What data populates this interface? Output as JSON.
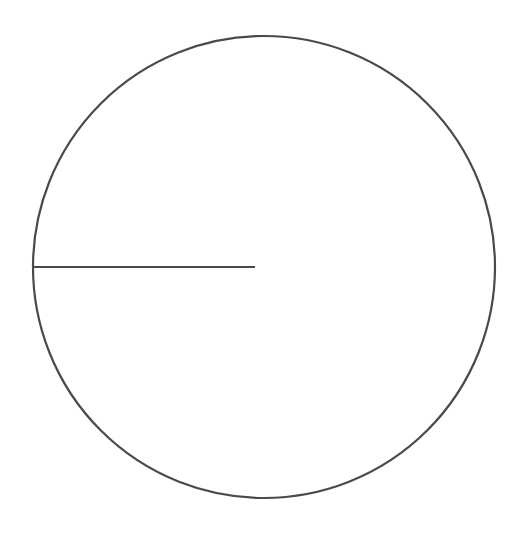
{
  "diagram": {
    "type": "circle-with-radius",
    "canvas": {
      "width": 527,
      "height": 541,
      "background": "#ffffff"
    },
    "circle": {
      "cx": 264,
      "cy": 267,
      "r": 231,
      "stroke": "#4a4a4a",
      "stroke_width": 2.2,
      "fill": "none"
    },
    "radius_line": {
      "x1": 33,
      "y1": 267,
      "x2": 255,
      "y2": 267,
      "stroke": "#4a4a4a",
      "stroke_width": 2.2
    }
  }
}
